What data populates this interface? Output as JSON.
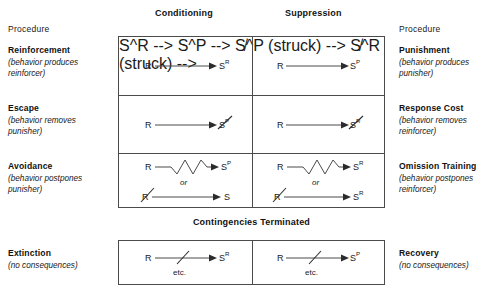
{
  "figure": {
    "column_headers": [
      {
        "label": "Conditioning",
        "x": 155,
        "y": 9
      },
      {
        "label": "Suppression",
        "x": 285,
        "y": 9
      }
    ],
    "banner": "Contingencies Terminated",
    "left_column": {
      "heading": "Procedure",
      "entries": [
        {
          "name": "Reinforcement",
          "note_line1": "(behavior produces",
          "note_line2": "reinforcer)"
        },
        {
          "name": "Escape",
          "note_line1": "(behavior removes",
          "note_line2": "punisher)"
        },
        {
          "name": "Avoidance",
          "note_line1": "(behavior postpones",
          "note_line2": "punisher)"
        },
        {
          "name": "Extinction",
          "note_line1": "(no consequences)",
          "note_line2": ""
        }
      ]
    },
    "right_column": {
      "heading": "Procedure",
      "entries": [
        {
          "name": "Punishment",
          "note_line1": "(behavior produces",
          "note_line2": "punisher)"
        },
        {
          "name": "Response Cost",
          "note_line1": "(behavior removes",
          "note_line2": "reinforcer)"
        },
        {
          "name": "Omission Training",
          "note_line1": "(behavior postpones",
          "note_line2": "reinforcer)"
        },
        {
          "name": "Recovery",
          "note_line1": "(no consequences)",
          "note_line2": ""
        }
      ]
    },
    "cells": {
      "reinforcement": {
        "response": "R",
        "stimulus": "S",
        "stimulus_sup": "R",
        "relation": "arrow",
        "struck_response": false,
        "struck_stimulus": false
      },
      "escape": {
        "response": "R",
        "stimulus": "S",
        "stimulus_sup": "P",
        "relation": "arrow",
        "struck_response": false,
        "struck_stimulus": true
      },
      "avoidance_a": {
        "response": "R",
        "stimulus": "S",
        "stimulus_sup": "P",
        "relation": "zigzag",
        "struck_response": false,
        "struck_stimulus": false
      },
      "avoidance_or": "or",
      "avoidance_b": {
        "response": "R",
        "stimulus": "S",
        "stimulus_sup": "",
        "relation": "arrow",
        "struck_response": true,
        "struck_stimulus": false
      },
      "punishment": {
        "response": "R",
        "stimulus": "S",
        "stimulus_sup": "P",
        "relation": "arrow",
        "struck_response": false,
        "struck_stimulus": false
      },
      "response_cost": {
        "response": "R",
        "stimulus": "S",
        "stimulus_sup": "R",
        "relation": "arrow",
        "struck_response": false,
        "struck_stimulus": true
      },
      "omission_a": {
        "response": "R",
        "stimulus": "S",
        "stimulus_sup": "R",
        "relation": "zigzag",
        "struck_response": false,
        "struck_stimulus": false
      },
      "omission_or": "or",
      "omission_b": {
        "response": "R",
        "stimulus": "S",
        "stimulus_sup": "R",
        "relation": "arrow",
        "struck_response": true,
        "struck_stimulus": false
      },
      "extinction": {
        "response": "R",
        "stimulus": "S",
        "stimulus_sup": "R",
        "relation": "broken-arrow",
        "etc": "etc."
      },
      "recovery": {
        "response": "R",
        "stimulus": "S",
        "stimulus_sup": "P",
        "relation": "broken-arrow",
        "etc": "etc."
      }
    },
    "colors": {
      "line": "#4b4b4b",
      "text": "#1a1a1a"
    }
  }
}
